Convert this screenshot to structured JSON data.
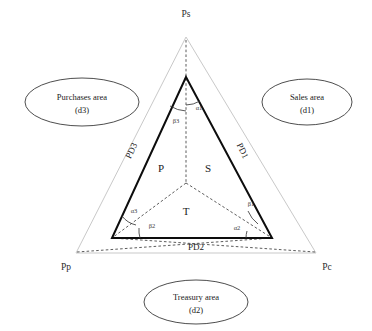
{
  "diagram": {
    "type": "triangle-geometry-diagram",
    "title": "",
    "colors": {
      "outer_triangle_stroke": "#c9c9c9",
      "inner_triangle_stroke": "#0d0d0d",
      "dashed_stroke": "#4a4a4a",
      "callout_stroke": "#3a3a3a",
      "background": "#ffffff",
      "text": "#1a1a1a"
    },
    "outer_vertices": [
      {
        "id": "Ps",
        "label": "Ps",
        "x": 186,
        "y": 37
      },
      {
        "id": "Pp",
        "label": "Pp",
        "x": 76,
        "y": 253
      },
      {
        "id": "Pc",
        "label": "Pc",
        "x": 316,
        "y": 253
      }
    ],
    "inner_vertices": [
      {
        "id": "S",
        "x": 186,
        "y": 77
      },
      {
        "id": "Pl",
        "x": 112,
        "y": 238
      },
      {
        "id": "Pr",
        "x": 272,
        "y": 238
      }
    ],
    "center_point": {
      "x": 186,
      "y": 183
    },
    "vertex_labels": {
      "top": "Ps",
      "bottom_left": "Pp",
      "bottom_right": "Pc"
    },
    "region_labels": [
      {
        "label": "P",
        "x": 161,
        "y": 172
      },
      {
        "label": "S",
        "x": 208,
        "y": 172
      },
      {
        "label": "T",
        "x": 186,
        "y": 215
      }
    ],
    "side_labels": [
      {
        "label": "PD1",
        "x": 240,
        "y": 152,
        "rotate": 64
      },
      {
        "label": "PD2",
        "x": 196,
        "y": 247,
        "rotate": 0
      },
      {
        "label": "PD3",
        "x": 134,
        "y": 152,
        "rotate": -64
      }
    ],
    "angle_labels": [
      {
        "label": "α1",
        "x": 196,
        "y": 107
      },
      {
        "label": "β3",
        "x": 176,
        "y": 117
      },
      {
        "label": "α3",
        "x": 133,
        "y": 211
      },
      {
        "label": "β2",
        "x": 148,
        "y": 226
      },
      {
        "label": "β1",
        "x": 250,
        "y": 204
      },
      {
        "label": "α2",
        "x": 236,
        "y": 227
      }
    ],
    "callouts": [
      {
        "id": "purchases",
        "line1": "Purchases area",
        "line2": "(d3)",
        "cx": 82,
        "cy": 102,
        "rx": 57,
        "ry": 24
      },
      {
        "id": "sales",
        "line1": "Sales area",
        "line2": "(d1)",
        "cx": 307,
        "cy": 102,
        "rx": 45,
        "ry": 23
      },
      {
        "id": "treasury",
        "line1": "Treasury area",
        "line2": "(d2)",
        "cx": 196,
        "cy": 302,
        "rx": 52,
        "ry": 22
      }
    ]
  }
}
